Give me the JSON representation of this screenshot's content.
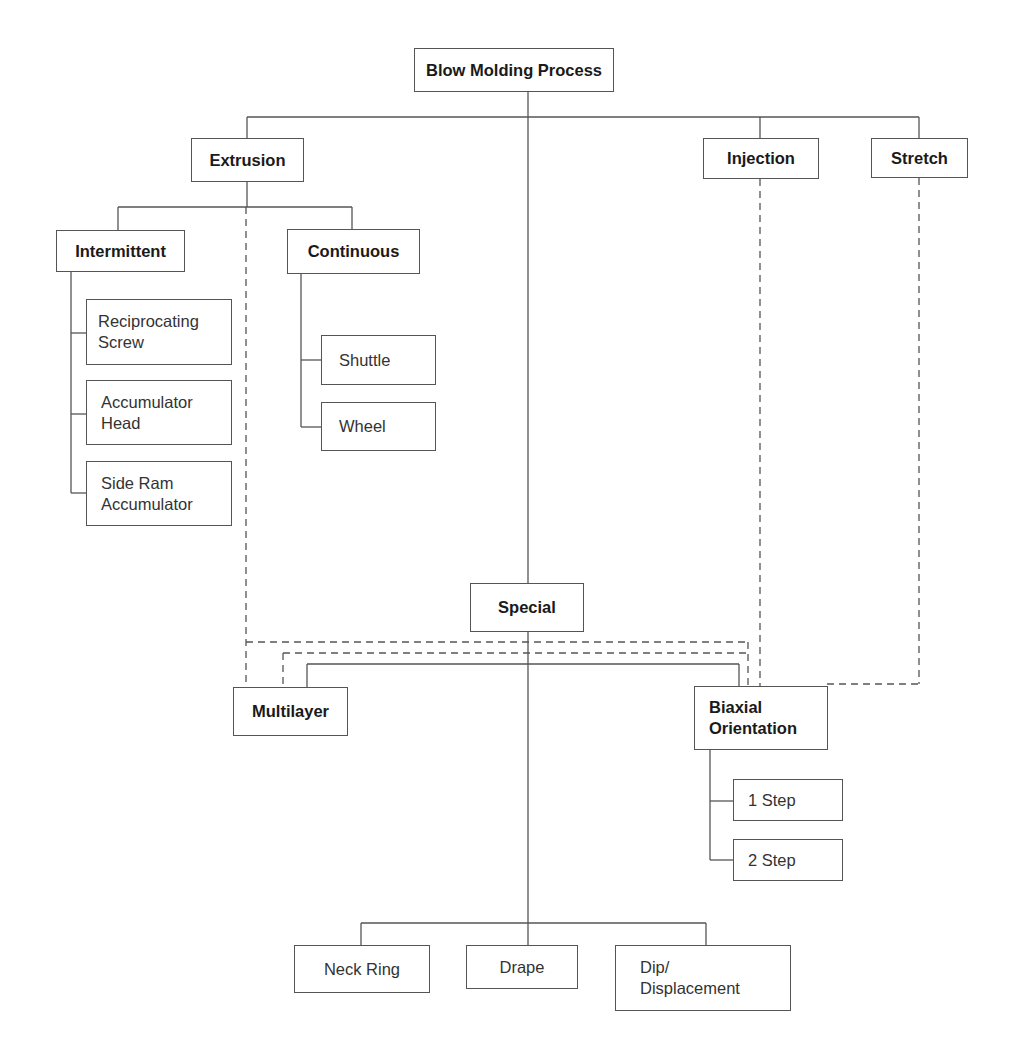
{
  "diagram": {
    "title": "Blow Molding Process",
    "colors": {
      "line": "#555555",
      "text": "#1a1a1a",
      "background": "#ffffff"
    },
    "nodes": {
      "root": "Blow Molding Process",
      "extrusion": "Extrusion",
      "injection": "Injection",
      "stretch": "Stretch",
      "intermittent": "Intermittent",
      "continuous": "Continuous",
      "reciprocating_screw": "Reciprocating\nScrew",
      "accumulator_head": "Accumulator\nHead",
      "side_ram_accumulator": "Side Ram\nAccumulator",
      "shuttle": "Shuttle",
      "wheel": "Wheel",
      "special": "Special",
      "multilayer": "Multilayer",
      "biaxial_orientation": "Biaxial\nOrientation",
      "one_step": "1 Step",
      "two_step": "2 Step",
      "neck_ring": "Neck Ring",
      "drape": "Drape",
      "dip_displacement": "Dip/\nDisplacement"
    },
    "edges": [
      {
        "from": "Blow Molding Process",
        "to": "Extrusion",
        "style": "solid"
      },
      {
        "from": "Blow Molding Process",
        "to": "Injection",
        "style": "solid"
      },
      {
        "from": "Blow Molding Process",
        "to": "Stretch",
        "style": "solid"
      },
      {
        "from": "Blow Molding Process",
        "to": "Special",
        "style": "solid"
      },
      {
        "from": "Extrusion",
        "to": "Intermittent",
        "style": "solid"
      },
      {
        "from": "Extrusion",
        "to": "Continuous",
        "style": "solid"
      },
      {
        "from": "Intermittent",
        "to": "Reciprocating Screw",
        "style": "solid"
      },
      {
        "from": "Intermittent",
        "to": "Accumulator Head",
        "style": "solid"
      },
      {
        "from": "Intermittent",
        "to": "Side Ram Accumulator",
        "style": "solid"
      },
      {
        "from": "Continuous",
        "to": "Shuttle",
        "style": "solid"
      },
      {
        "from": "Continuous",
        "to": "Wheel",
        "style": "solid"
      },
      {
        "from": "Special",
        "to": "Multilayer",
        "style": "solid"
      },
      {
        "from": "Special",
        "to": "Biaxial Orientation",
        "style": "solid"
      },
      {
        "from": "Special",
        "to": "Neck Ring",
        "style": "solid"
      },
      {
        "from": "Special",
        "to": "Drape",
        "style": "solid"
      },
      {
        "from": "Special",
        "to": "Dip/Displacement",
        "style": "solid"
      },
      {
        "from": "Biaxial Orientation",
        "to": "1 Step",
        "style": "solid"
      },
      {
        "from": "Biaxial Orientation",
        "to": "2 Step",
        "style": "solid"
      },
      {
        "from": "Extrusion",
        "to": "Multilayer",
        "style": "dashed"
      },
      {
        "from": "Extrusion",
        "to": "Biaxial Orientation",
        "style": "dashed"
      },
      {
        "from": "Multilayer",
        "to": "Biaxial Orientation",
        "style": "dashed"
      },
      {
        "from": "Injection",
        "to": "Biaxial Orientation",
        "style": "dashed"
      },
      {
        "from": "Stretch",
        "to": "Biaxial Orientation",
        "style": "dashed"
      }
    ]
  }
}
